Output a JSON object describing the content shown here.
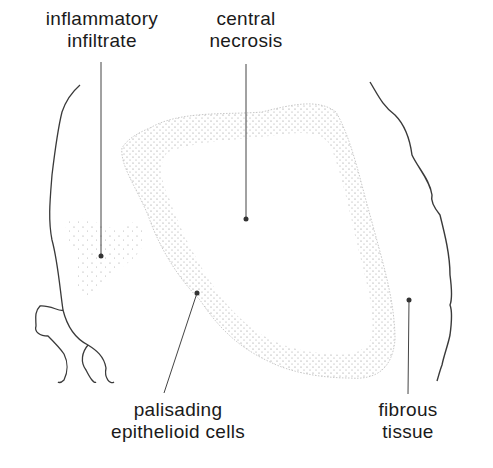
{
  "figure": {
    "labels": [
      {
        "id": "inflammatory-infiltrate",
        "lines": [
          "inflammatory",
          "infiltrate"
        ]
      },
      {
        "id": "central-necrosis",
        "lines": [
          "central",
          "necrosis"
        ]
      },
      {
        "id": "palisading-epithelioid-cells",
        "lines": [
          "palisading",
          "epithelioid cells"
        ]
      },
      {
        "id": "fibrous-tissue",
        "lines": [
          "fibrous",
          "tissue"
        ]
      }
    ],
    "colors": {
      "background": "#ffffff",
      "ink": "#333333",
      "stipple": "#8a8a8a",
      "text": "#1a1a1a"
    }
  }
}
